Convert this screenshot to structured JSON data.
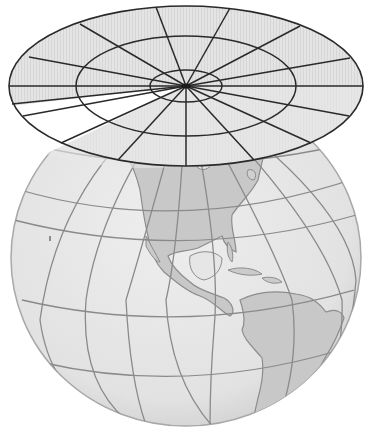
{
  "figure": {
    "title": "Azimuthal (planar) map projection",
    "colors": {
      "background": "#ffffff",
      "ocean": "#e6e6e6",
      "land": "#c9c9c9",
      "coastline": "#8c8c8c",
      "graticule": "#8a8a8a",
      "plane_fill": "#e2e2e2",
      "plane_shade": "#d2d2d2",
      "plane_lines": "#2a2a2a"
    },
    "globe": {
      "cx": 186,
      "cy": 258,
      "rx": 175,
      "ry": 168
    },
    "plane": {
      "cx": 186,
      "cy": 86,
      "outer": {
        "rx": 177,
        "ry": 80
      },
      "middle": {
        "rx": 110,
        "ry": 50
      },
      "inner": {
        "rx": 36,
        "ry": 16
      },
      "radial_lines": 16,
      "tangent_point": "North Pole"
    },
    "labels": {
      "continents": [
        "North America",
        "South America"
      ]
    }
  }
}
